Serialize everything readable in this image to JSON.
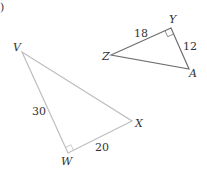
{
  "problem": {
    "label_fragment": ")"
  },
  "triangles": [
    {
      "id": "ZYA",
      "stroke": "#6e6e6e",
      "vertices": {
        "Z": {
          "label": "Z",
          "x": 111,
          "y": 55
        },
        "Y": {
          "label": "Y",
          "x": 171,
          "y": 28
        },
        "A": {
          "label": "A",
          "x": 189,
          "y": 69
        }
      },
      "right_angle_at": "Y",
      "sides": {
        "ZY": "18",
        "YA": "12"
      }
    },
    {
      "id": "VWX",
      "stroke": "#bdbdbd",
      "vertices": {
        "V": {
          "label": "V",
          "x": 22,
          "y": 52
        },
        "W": {
          "label": "W",
          "x": 68,
          "y": 153
        },
        "X": {
          "label": "X",
          "x": 132,
          "y": 121
        }
      },
      "right_angle_at": "W",
      "sides": {
        "VW": "30",
        "WX": "20"
      }
    }
  ]
}
